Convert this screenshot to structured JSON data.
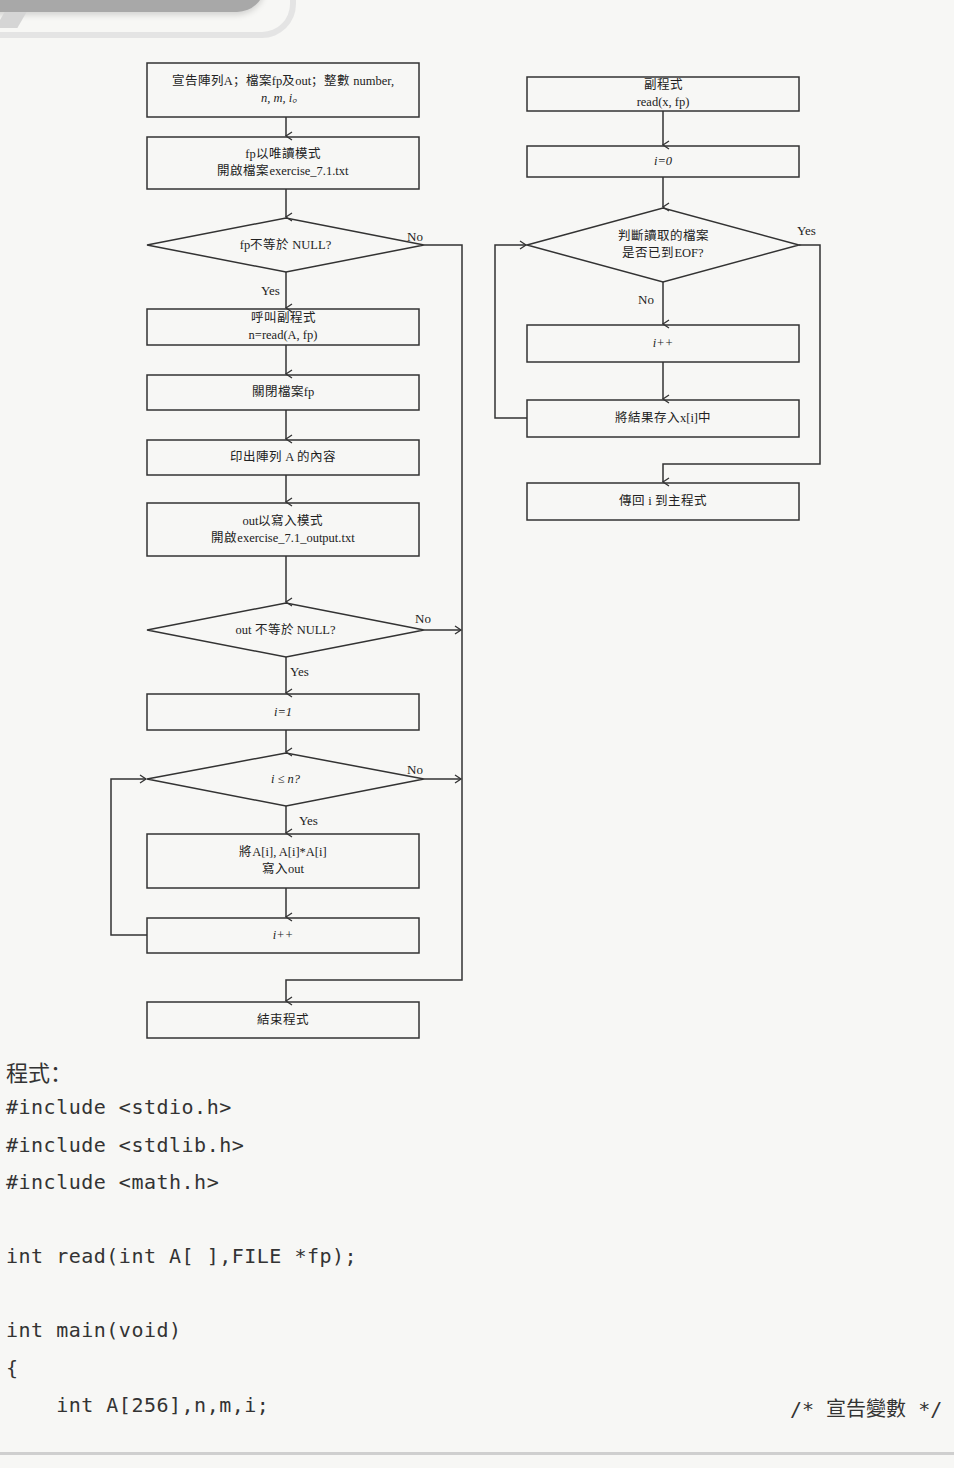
{
  "main_flow": {
    "declare": {
      "line1": "宣告陣列A；檔案fp及out；整數 number,",
      "line2": "n, m, i。"
    },
    "open_read": {
      "line1": "fp以唯讀模式",
      "line2": "開啟檔案exercise_7.1.txt"
    },
    "decision_fp": "fp不等於 NULL?",
    "call_read": {
      "line1": "呼叫副程式",
      "line2": "n=read(A, fp)"
    },
    "close_fp": "關閉檔案fp",
    "print_a": "印出陣列 A 的內容",
    "open_write": {
      "line1": "out以寫入模式",
      "line2": "開啟exercise_7.1_output.txt"
    },
    "decision_out": "out 不等於 NULL?",
    "init_i": "i=1",
    "decision_loop": "i ≤ n?",
    "write_out": {
      "line1": "將A[i], A[i]*A[i]",
      "line2": "寫入out"
    },
    "increment": "i++",
    "end": "結束程式",
    "yes": "Yes",
    "no": "No"
  },
  "sub_flow": {
    "header": {
      "line1": "副程式",
      "line2": "read(x, fp)"
    },
    "init_i": "i=0",
    "decision_eof": {
      "line1": "判斷讀取的檔案",
      "line2": "是否已到EOF?"
    },
    "increment": "i++",
    "store": "將結果存入x[i]中",
    "return": "傳回 i 到主程式",
    "yes": "Yes",
    "no": "No"
  },
  "code": {
    "title": "程式：",
    "lines": [
      "#include <stdio.h>",
      "#include <stdlib.h>",
      "#include <math.h>",
      "",
      "int read(int A[ ],FILE *fp);",
      "",
      "int main(void)",
      "{",
      "    int A[256],n,m,i;"
    ],
    "comment": "/* 宣告變數 */"
  },
  "colors": {
    "line": "#333333",
    "background": "#f7f7f5",
    "banner": "#a8a8a8"
  }
}
